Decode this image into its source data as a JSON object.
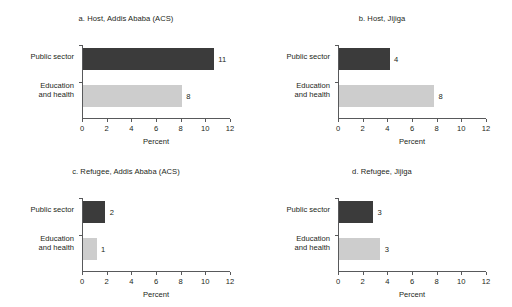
{
  "chart_data": {
    "type": "bar",
    "orientation": "horizontal",
    "grid": false,
    "legend": false,
    "categories": [
      "Public sector",
      "Education and health"
    ],
    "xlabel": "Percent",
    "ylabel": "",
    "xlim": [
      0,
      12
    ],
    "xticks": [
      0,
      2,
      4,
      6,
      8,
      10,
      12
    ],
    "colors": {
      "public_sector": "#3b3b3b",
      "education_and_health": "#cdcdcd",
      "axis": "#58595b",
      "text": "#231f20",
      "background": "#ffffff"
    },
    "panels": [
      {
        "id": "a",
        "title": "a. Host, Addis Ababa (ACS)",
        "bars": [
          {
            "category": "Public sector",
            "value": 10.6,
            "label": "11",
            "color": "#3b3b3b"
          },
          {
            "category": "Education and health",
            "value": 8.0,
            "label": "8",
            "color": "#cdcdcd"
          }
        ]
      },
      {
        "id": "b",
        "title": "b. Host, Jijiga",
        "bars": [
          {
            "category": "Public sector",
            "value": 4.1,
            "label": "4",
            "color": "#3b3b3b"
          },
          {
            "category": "Education and health",
            "value": 7.7,
            "label": "8",
            "color": "#cdcdcd"
          }
        ]
      },
      {
        "id": "c",
        "title": "c. Refugee, Addis Ababa (ACS)",
        "bars": [
          {
            "category": "Public sector",
            "value": 1.8,
            "label": "2",
            "color": "#3b3b3b"
          },
          {
            "category": "Education and health",
            "value": 1.1,
            "label": "1",
            "color": "#cdcdcd"
          }
        ]
      },
      {
        "id": "d",
        "title": "d. Refugee, Jijiga",
        "bars": [
          {
            "category": "Public sector",
            "value": 2.75,
            "label": "3",
            "color": "#3b3b3b"
          },
          {
            "category": "Education and health",
            "value": 3.35,
            "label": "3",
            "color": "#cdcdcd"
          }
        ]
      }
    ]
  },
  "labels": {
    "cat_public_sector": "Public sector",
    "cat_education_line1": "Education",
    "cat_education_line2": "and health",
    "xaxis_title": "Percent",
    "tick_0": "0",
    "tick_2": "2",
    "tick_4": "4",
    "tick_6": "6",
    "tick_8": "8",
    "tick_10": "10",
    "tick_12": "12"
  }
}
